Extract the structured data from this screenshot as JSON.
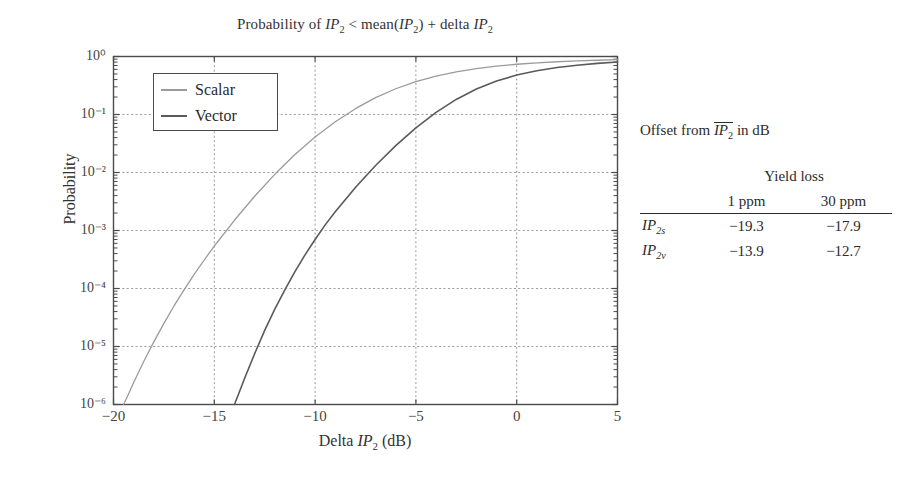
{
  "chart_data": {
    "type": "line",
    "xlabel": "Delta IP₂ (dB)",
    "ylabel": "Probability",
    "yscale": "log",
    "xlim": [
      -20,
      5
    ],
    "ylim": [
      1e-06,
      1
    ],
    "xticks": [
      -20,
      -15,
      -10,
      -5,
      0,
      5
    ],
    "xticklabels": [
      "−20",
      "−15",
      "−10",
      "−5",
      "0",
      "5"
    ],
    "yticks": [
      1,
      0.1,
      0.01,
      0.001,
      0.0001,
      1e-05,
      1e-06
    ],
    "yticklabels": [
      "10⁰",
      "10⁻¹",
      "10⁻²",
      "10⁻³",
      "10⁻⁴",
      "10⁻⁵",
      "10⁻⁶"
    ],
    "grid": true,
    "grid_style": "dashed",
    "legend_position": "upper left",
    "series": [
      {
        "name": "Scalar",
        "color": "#9b9b9b",
        "x": [
          -19.5,
          -19.3,
          -19.0,
          -18.5,
          -18.0,
          -17.5,
          -17.0,
          -16.5,
          -16.0,
          -15.5,
          -15.0,
          -14.0,
          -13.0,
          -12.0,
          -11.0,
          -10.0,
          -9.0,
          -8.0,
          -7.0,
          -6.0,
          -5.0,
          -4.0,
          -3.0,
          -2.0,
          -1.0,
          0.0,
          1.0,
          2.0,
          3.0,
          4.0,
          5.0
        ],
        "y": [
          1e-06,
          1.4e-06,
          2.4e-06,
          5.5e-06,
          1.2e-05,
          2.5e-05,
          5e-05,
          9.5e-05,
          0.000175,
          0.00031,
          0.00054,
          0.0015,
          0.0039,
          0.0093,
          0.0205,
          0.041,
          0.075,
          0.126,
          0.195,
          0.278,
          0.368,
          0.458,
          0.542,
          0.618,
          0.682,
          0.735,
          0.778,
          0.812,
          0.84,
          0.862,
          0.88
        ]
      },
      {
        "name": "Vector",
        "color": "#5a5a5a",
        "x": [
          -14.0,
          -13.8,
          -13.5,
          -13.0,
          -12.5,
          -12.0,
          -11.5,
          -11.0,
          -10.5,
          -10.0,
          -9.5,
          -9.0,
          -8.0,
          -7.0,
          -6.0,
          -5.0,
          -4.0,
          -3.0,
          -2.0,
          -1.0,
          0.0,
          1.0,
          2.0,
          3.0,
          4.0,
          5.0
        ],
        "y": [
          1e-06,
          1.5e-06,
          2.8e-06,
          7.5e-06,
          1.9e-05,
          4.4e-05,
          9.5e-05,
          0.000195,
          0.00038,
          0.0007,
          0.00125,
          0.0021,
          0.0055,
          0.0132,
          0.029,
          0.059,
          0.109,
          0.182,
          0.275,
          0.378,
          0.478,
          0.568,
          0.645,
          0.708,
          0.76,
          0.802
        ]
      }
    ],
    "annotations": []
  },
  "legend": {
    "entries": [
      {
        "label": "Scalar",
        "color": "#9b9b9b"
      },
      {
        "label": "Vector",
        "color": "#5a5a5a"
      }
    ]
  },
  "side_table": {
    "caption_prefix": "Offset from ",
    "caption_overline": "IP",
    "caption_overline_sub": "2",
    "caption_suffix": " in dB",
    "group_header": "Yield loss",
    "columns": [
      "1 ppm",
      "30 ppm"
    ],
    "rows": [
      {
        "label_base": "IP",
        "label_sub": "2s",
        "values": [
          "−19.3",
          "−17.9"
        ]
      },
      {
        "label_base": "IP",
        "label_sub": "2v",
        "values": [
          "−13.9",
          "−12.7"
        ]
      }
    ]
  },
  "colors": {
    "axis": "#4a4a4a",
    "grid": "#9a9a9a",
    "text": "#2b2b2b",
    "scalar": "#9b9b9b",
    "vector": "#5a5a5a"
  }
}
